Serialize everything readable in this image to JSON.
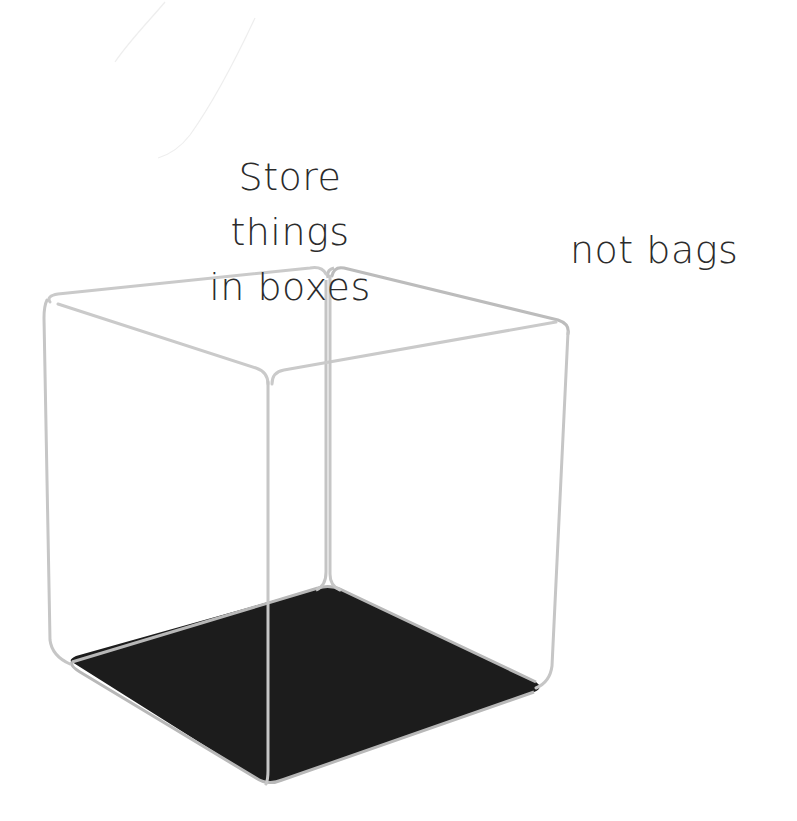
{
  "illustration": {
    "subject": "transparent cube with dark floor",
    "colors": {
      "background": "#ffffff",
      "edge": "#c8c8c8",
      "edge_shadow": "#b0b0b0",
      "floor": "#1c1c1c",
      "text": "#2b2b2b",
      "faint_stroke": "#ececec"
    }
  },
  "captions": {
    "main": {
      "line1": "Store",
      "line2": "things",
      "line3": "in boxes"
    },
    "side": "not bags"
  }
}
